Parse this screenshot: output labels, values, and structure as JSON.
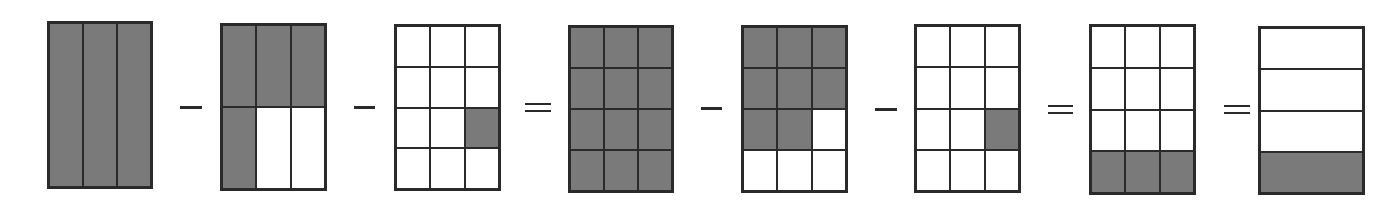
{
  "diagram": {
    "colors": {
      "shaded": "#7a7a7a",
      "border": "#2a2a2a",
      "background": "#ffffff"
    },
    "figures": [
      {
        "id": "fig1",
        "label": "whole-1",
        "x": 47,
        "y": 21,
        "w": 106,
        "h": 168,
        "cols": 3,
        "rows": 1,
        "shaded": [
          0,
          1,
          2
        ]
      },
      {
        "id": "fig2",
        "label": "four-sixths",
        "x": 220,
        "y": 23,
        "w": 107,
        "h": 168,
        "cols": 3,
        "rows": 2,
        "shaded": [
          0,
          1,
          2,
          3
        ]
      },
      {
        "id": "fig3",
        "label": "one-twelfth",
        "x": 394,
        "y": 24,
        "w": 107,
        "h": 167,
        "cols": 3,
        "rows": 4,
        "shaded": [
          8
        ]
      },
      {
        "id": "fig4",
        "label": "twelve-twelfths",
        "x": 568,
        "y": 25,
        "w": 106,
        "h": 168,
        "cols": 3,
        "rows": 4,
        "shaded": [
          0,
          1,
          2,
          3,
          4,
          5,
          6,
          7,
          8,
          9,
          10,
          11
        ]
      },
      {
        "id": "fig5",
        "label": "eight-twelfths",
        "x": 741,
        "y": 25,
        "w": 107,
        "h": 168,
        "cols": 3,
        "rows": 4,
        "shaded": [
          0,
          1,
          2,
          3,
          4,
          5,
          6,
          7
        ]
      },
      {
        "id": "fig6",
        "label": "one-twelfth",
        "x": 914,
        "y": 24,
        "w": 107,
        "h": 169,
        "cols": 3,
        "rows": 4,
        "shaded": [
          8
        ]
      },
      {
        "id": "fig7",
        "label": "three-twelfths",
        "x": 1089,
        "y": 24,
        "w": 107,
        "h": 171,
        "cols": 3,
        "rows": 4,
        "shaded": [
          9,
          10,
          11
        ]
      },
      {
        "id": "fig8",
        "label": "one-fourth",
        "x": 1258,
        "y": 26,
        "w": 107,
        "h": 169,
        "cols": 1,
        "rows": 4,
        "shaded": [
          3
        ]
      }
    ],
    "operators": [
      {
        "type": "minus",
        "x": 180,
        "y": 106,
        "w": 22
      },
      {
        "type": "minus",
        "x": 354,
        "y": 106,
        "w": 21
      },
      {
        "type": "equals",
        "x": 525,
        "y": 103,
        "w": 26
      },
      {
        "type": "minus",
        "x": 701,
        "y": 107,
        "w": 21
      },
      {
        "type": "minus",
        "x": 875,
        "y": 108,
        "w": 22
      },
      {
        "type": "equals",
        "x": 1048,
        "y": 105,
        "w": 25
      },
      {
        "type": "equals",
        "x": 1224,
        "y": 105,
        "w": 26
      }
    ]
  }
}
